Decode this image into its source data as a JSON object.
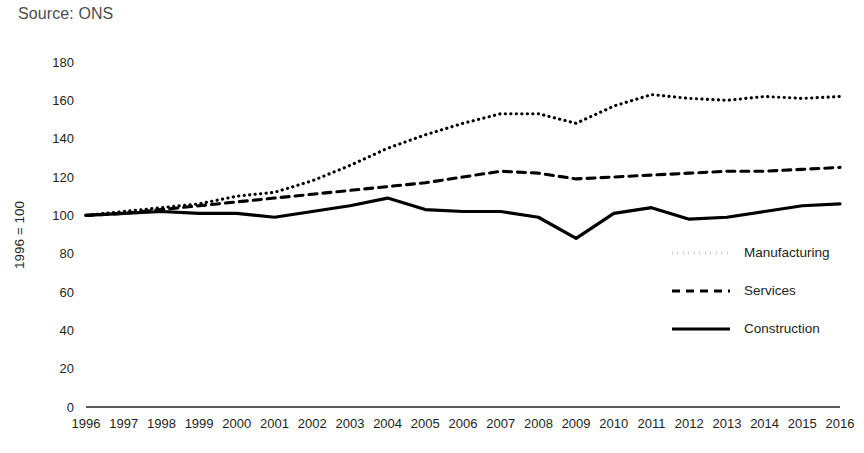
{
  "source_note": "Source: ONS",
  "chart_data": {
    "type": "line",
    "title": "",
    "subtitle": "",
    "xlabel": "",
    "ylabel": "1996 = 100",
    "x": [
      1996,
      1997,
      1998,
      1999,
      2000,
      2001,
      2002,
      2003,
      2004,
      2005,
      2006,
      2007,
      2008,
      2009,
      2010,
      2011,
      2012,
      2013,
      2014,
      2015,
      2016
    ],
    "categories": [
      "1996",
      "1997",
      "1998",
      "1999",
      "2000",
      "2001",
      "2002",
      "2003",
      "2004",
      "2005",
      "2006",
      "2007",
      "2008",
      "2009",
      "2010",
      "2011",
      "2012",
      "2013",
      "2014",
      "2015",
      "2016"
    ],
    "ylim": [
      0,
      180
    ],
    "yticks": [
      0,
      20,
      40,
      60,
      80,
      100,
      120,
      140,
      160,
      180
    ],
    "ytick_labels": [
      "0",
      "20",
      "40",
      "60",
      "80",
      "100",
      "120",
      "140",
      "160",
      "180"
    ],
    "grid": false,
    "legend_position": "center-right",
    "series": [
      {
        "name": "Manufacturing",
        "style": "dotted",
        "color": "#000000",
        "values": [
          100,
          102,
          104,
          106,
          110,
          112,
          118,
          126,
          135,
          142,
          148,
          153,
          153,
          148,
          157,
          163,
          161,
          160,
          162,
          161,
          162
        ]
      },
      {
        "name": "Services",
        "style": "dashed",
        "color": "#000000",
        "values": [
          100,
          101,
          103,
          105,
          107,
          109,
          111,
          113,
          115,
          117,
          120,
          123,
          122,
          119,
          120,
          121,
          122,
          123,
          123,
          124,
          125
        ]
      },
      {
        "name": "Construction",
        "style": "solid",
        "color": "#000000",
        "values": [
          100,
          101,
          102,
          101,
          101,
          99,
          102,
          105,
          109,
          103,
          102,
          102,
          99,
          88,
          101,
          104,
          98,
          99,
          102,
          105,
          106
        ]
      }
    ]
  }
}
